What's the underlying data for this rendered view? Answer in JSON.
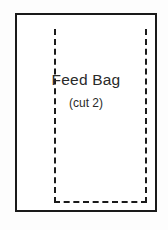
{
  "diagram": {
    "type": "sewing-pattern-piece",
    "piece_name": "Feed Bag",
    "cut_instruction": "(cut 2)",
    "outline": {
      "style": "solid",
      "color": "#1a1a1a",
      "stroke_width": 2,
      "fill": "#ffffff"
    },
    "stitch_guide": {
      "style": "dashed",
      "color": "#1a1a1a",
      "stroke_width": 2,
      "edges": "left, right, bottom (top open)"
    },
    "background_color": "#fdfdfd"
  }
}
